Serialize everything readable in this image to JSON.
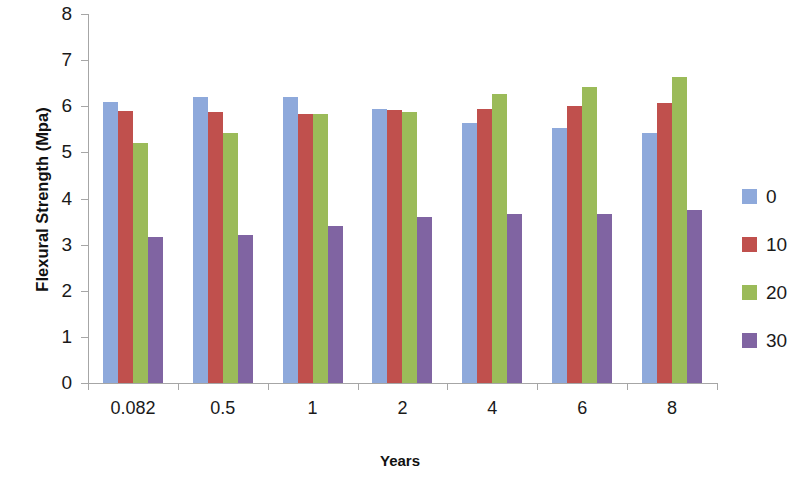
{
  "chart_data": {
    "type": "bar",
    "title": "",
    "xlabel": "Years",
    "ylabel": "Flexural Strength (Mpa)",
    "categories": [
      "0.082",
      "0.5",
      "1",
      "2",
      "4",
      "6",
      "8"
    ],
    "series": [
      {
        "name": "0",
        "color": "#8EA9DB",
        "values": [
          6.1,
          6.2,
          6.2,
          5.95,
          5.63,
          5.52,
          5.42
        ]
      },
      {
        "name": "10",
        "color": "#C0504D",
        "values": [
          5.89,
          5.88,
          5.84,
          5.92,
          5.95,
          6.0,
          6.07
        ]
      },
      {
        "name": "20",
        "color": "#9BBB59",
        "values": [
          5.21,
          5.42,
          5.84,
          5.88,
          6.26,
          6.42,
          6.64
        ]
      },
      {
        "name": "30",
        "color": "#8064A2",
        "values": [
          3.17,
          3.21,
          3.4,
          3.6,
          3.67,
          3.67,
          3.75
        ]
      }
    ],
    "ylim": [
      0,
      8
    ],
    "yticks": [
      0,
      1,
      2,
      3,
      4,
      5,
      6,
      7,
      8
    ],
    "ytick_labels": [
      "0",
      "1",
      "2",
      "3",
      "4",
      "5",
      "6",
      "7",
      "8"
    ],
    "grid": false,
    "legend_position": "right",
    "legend_entries": [
      "0",
      "10",
      "20",
      "30"
    ]
  }
}
